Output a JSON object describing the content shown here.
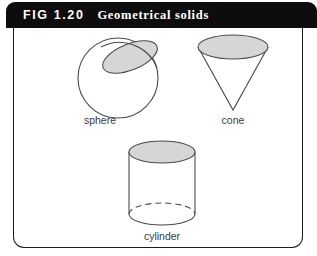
{
  "figure": {
    "number": "FIG 1.20",
    "title": "Geometrical solids",
    "header_bg": "#0d0d0d",
    "header_text_color": "#ffffff",
    "panel_bg": "#ffffff",
    "panel_border_color": "#1a1a1a",
    "stroke_color": "#4a4a4a",
    "shade_fill": "#d6d6d6"
  },
  "shapes": [
    {
      "name": "sphere",
      "label": "sphere",
      "type": "sphere-with-shaded-cap",
      "center": [
        118,
        78
      ],
      "radius": 40,
      "cap": {
        "cx": 130,
        "cy": 57,
        "rx": 29,
        "ry": 13,
        "rotation": -22
      }
    },
    {
      "name": "cone",
      "label": "cone",
      "type": "cone-apex-down",
      "base_ellipse": {
        "cx": 233,
        "cy": 47,
        "rx": 35,
        "ry": 12
      },
      "apex": [
        233,
        110
      ]
    },
    {
      "name": "cylinder",
      "label": "cylinder",
      "type": "cylinder",
      "top_ellipse": {
        "cx": 162,
        "cy": 152,
        "rx": 33,
        "ry": 11
      },
      "bottom_ellipse": {
        "cx": 162,
        "cy": 214,
        "rx": 33,
        "ry": 11
      },
      "hidden_back_arc": "dashed"
    }
  ]
}
